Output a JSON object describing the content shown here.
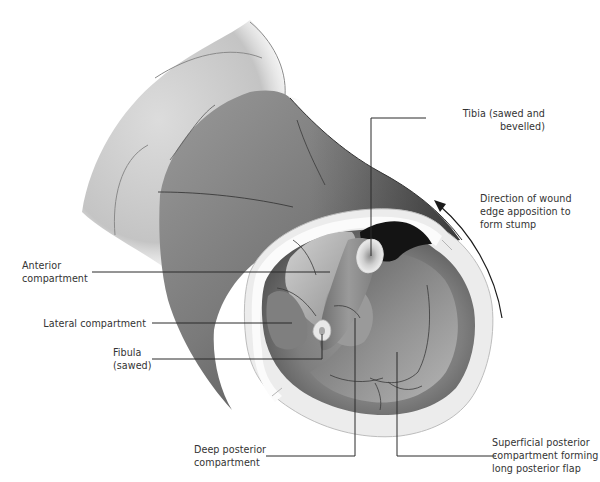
{
  "figure": {
    "colors": {
      "background": "#ffffff",
      "leader_line": "#2a2a2a",
      "label_text": "#333333",
      "skin_light": "#d4d4d4",
      "skin_dark": "#5a5a5a",
      "muscle_mid": "#8a8a8a",
      "skin_edge": "#e6e6e6",
      "bone_light": "#f2f2f2",
      "cavity_dark": "#141414"
    },
    "labels": {
      "tibia": "Tibia  (sawed and\nbevelled)",
      "direction": "Direction of wound\nedge apposition to\nform stump",
      "anterior": "Anterior\ncompartment",
      "lateral": "Lateral compartment",
      "fibula": "Fibula\n(sawed)",
      "deep_posterior": "Deep  posterior\ncompartment",
      "superficial_posterior": "Superficial posterior\ncompartment forming\nlong posterior flap"
    },
    "arrow": {
      "name": "direction-arrow",
      "meaning": "Direction of wound edge apposition to form stump"
    }
  }
}
